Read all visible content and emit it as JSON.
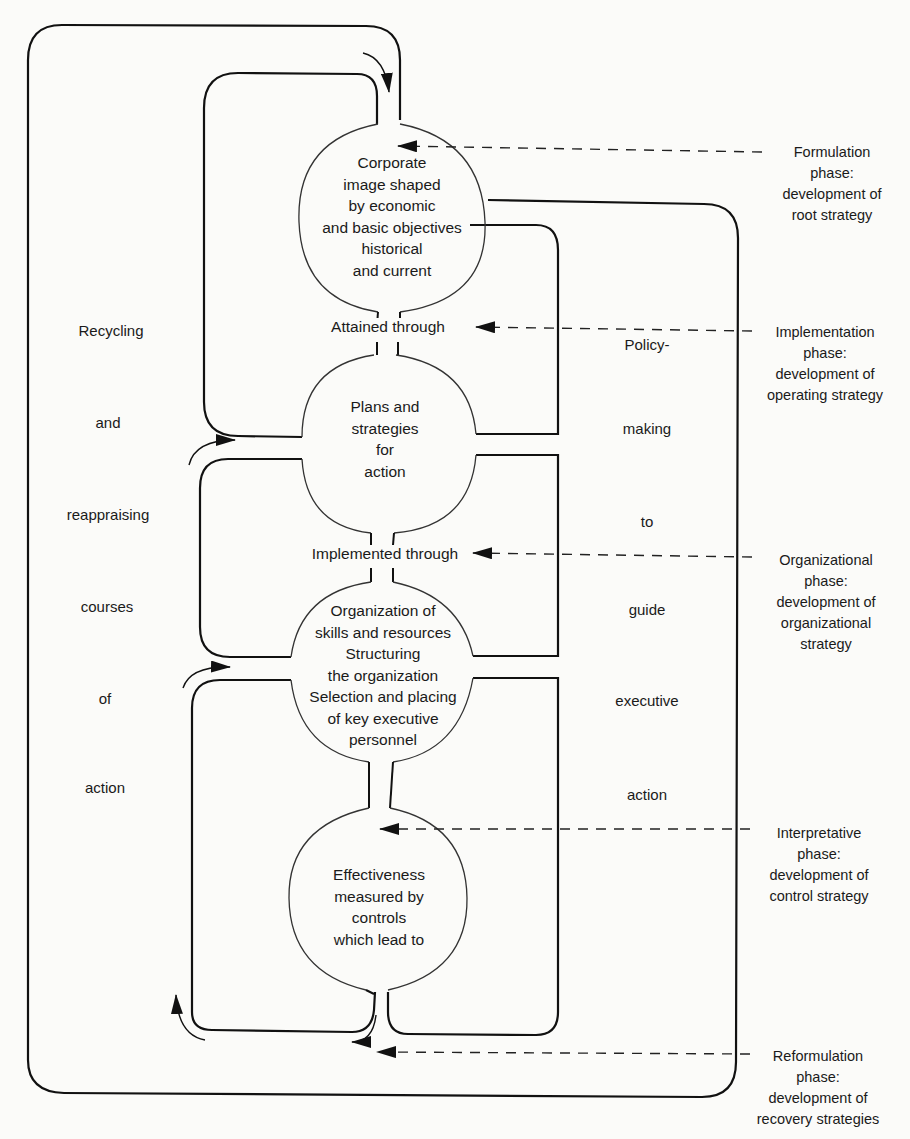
{
  "diagram": {
    "nodes": [
      {
        "id": "corporate-image",
        "lines": [
          "Corporate",
          "image shaped",
          "by economic",
          "and basic objectives",
          "historical",
          "and current"
        ]
      },
      {
        "id": "plans-strategies",
        "lines": [
          "Plans and",
          "strategies",
          "for",
          "action"
        ]
      },
      {
        "id": "organization",
        "lines": [
          "Organization of",
          "skills and resources",
          "Structuring",
          "the organization",
          "Selection and placing",
          "of key executive",
          "personnel"
        ]
      },
      {
        "id": "effectiveness",
        "lines": [
          "Effectiveness",
          "measured by",
          "controls",
          "which lead to"
        ]
      }
    ],
    "connectors": [
      {
        "id": "attained-through",
        "label": "Attained through"
      },
      {
        "id": "implemented-through",
        "label": "Implemented through"
      }
    ],
    "left_column": [
      "Recycling",
      "and",
      "reappraising",
      "courses",
      "of",
      "action"
    ],
    "right_column": [
      "Policy-",
      "making",
      "to",
      "guide",
      "executive",
      "action"
    ],
    "phases": [
      {
        "id": "formulation",
        "lines": [
          "Formulation",
          "phase:",
          "development of",
          "root strategy"
        ]
      },
      {
        "id": "implementation",
        "lines": [
          "Implementation",
          "phase:",
          "development of",
          "operating strategy"
        ]
      },
      {
        "id": "organizational",
        "lines": [
          "Organizational",
          "phase:",
          "development of",
          "organizational",
          "strategy"
        ]
      },
      {
        "id": "interpretative",
        "lines": [
          "Interpretative",
          "phase:",
          "development of",
          "control strategy"
        ]
      },
      {
        "id": "reformulation",
        "lines": [
          "Reformulation",
          "phase:",
          "development of",
          "recovery strategies"
        ]
      }
    ],
    "colors": {
      "line": "#111111",
      "background": "#fbfbf9",
      "text": "#1a1a1a"
    }
  }
}
